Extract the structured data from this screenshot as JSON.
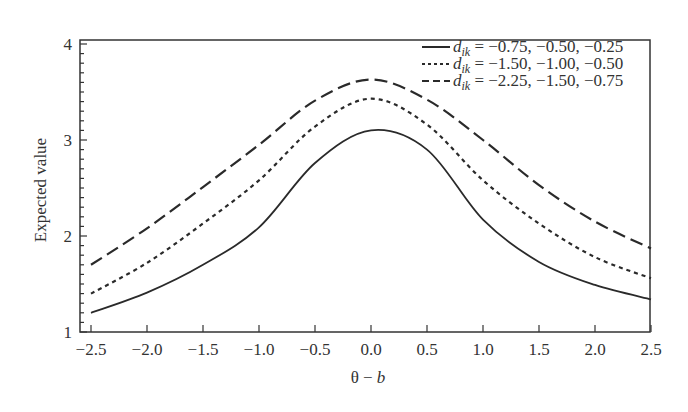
{
  "chart_data": {
    "type": "line",
    "title": "",
    "xlabel": "θ − b",
    "ylabel": "Expected value",
    "xlim": [
      -2.5,
      2.5
    ],
    "ylim": [
      1,
      4.1
    ],
    "grid": false,
    "legend_position": "upper right",
    "x": [
      -2.5,
      -2.0,
      -1.5,
      -1.0,
      -0.5,
      0.0,
      0.5,
      1.0,
      1.5,
      2.0,
      2.5
    ],
    "x_tick_labels": [
      "−2.5",
      "−2.0",
      "−1.5",
      "−1.0",
      "−0.5",
      "0.0",
      "0.5",
      "1.0",
      "1.5",
      "2.0",
      "2.5"
    ],
    "y_ticks": [
      1,
      2,
      3,
      4
    ],
    "y_tick_labels": [
      "1",
      "2",
      "3",
      "4"
    ],
    "series": [
      {
        "name": "d_ik = −0.75, −0.50, −0.25",
        "legend_prefix": "d",
        "legend_sub": "ik",
        "legend_rest": " = −0.75, −0.50, −0.25",
        "style": "solid",
        "values": [
          1.2,
          1.41,
          1.7,
          2.09,
          2.76,
          3.1,
          2.9,
          2.17,
          1.73,
          1.49,
          1.34
        ]
      },
      {
        "name": "d_ik = −1.50, −1.00, −0.50",
        "legend_prefix": "d",
        "legend_sub": "ik",
        "legend_rest": " = −1.50, −1.00, −0.50",
        "style": "dotted",
        "values": [
          1.4,
          1.72,
          2.13,
          2.58,
          3.14,
          3.43,
          3.16,
          2.58,
          2.13,
          1.78,
          1.56
        ]
      },
      {
        "name": "d_ik = −2.25, −1.50, −0.75",
        "legend_prefix": "d",
        "legend_sub": "ik",
        "legend_rest": " = −2.25, −1.50, −0.75",
        "style": "dashed",
        "values": [
          1.7,
          2.08,
          2.51,
          2.95,
          3.41,
          3.63,
          3.42,
          3.0,
          2.53,
          2.15,
          1.87
        ]
      }
    ]
  }
}
